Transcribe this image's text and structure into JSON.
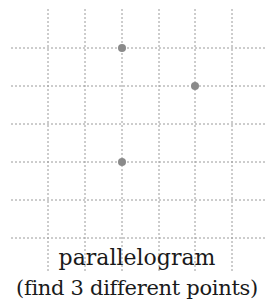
{
  "diagram": {
    "title": "parallelogram",
    "instruction": "(find 3 different points)",
    "colors": {
      "grid_line": "#9a9a9a",
      "point": "#8a8a8a",
      "text": "#1a1a1a",
      "background": "#ffffff"
    },
    "grid": {
      "vertical_x": [
        48,
        85,
        122,
        159,
        195,
        232
      ],
      "vertical_y_range": [
        9,
        273
      ],
      "horizontal_y": [
        48,
        86,
        124,
        162,
        200,
        238
      ],
      "horizontal_x_range": [
        11,
        265
      ],
      "columns": 6,
      "rows": 6
    },
    "points": [
      {
        "label": "point-a",
        "grid_col": 2,
        "grid_row": 0,
        "x": 122,
        "y": 48
      },
      {
        "label": "point-b",
        "grid_col": 4,
        "grid_row": 1,
        "x": 195,
        "y": 86
      },
      {
        "label": "point-c",
        "grid_col": 2,
        "grid_row": 3,
        "x": 122,
        "y": 162
      }
    ],
    "point_radius": 4
  }
}
